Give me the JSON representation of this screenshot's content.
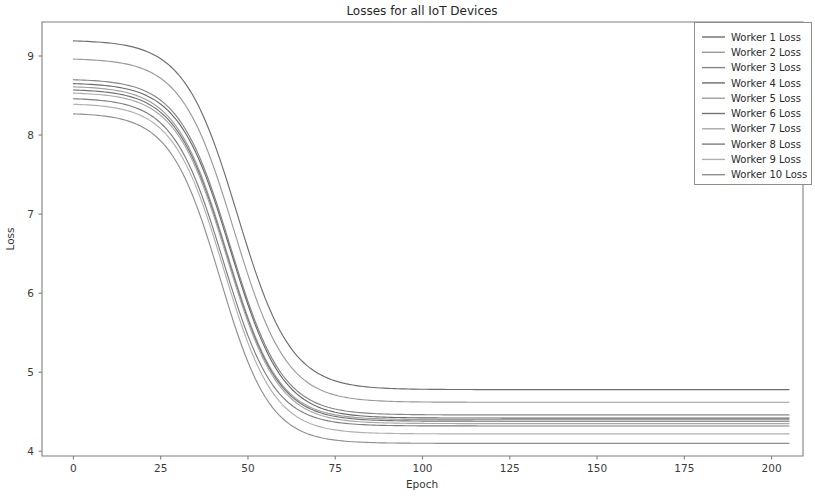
{
  "chart_data": {
    "type": "line",
    "title": "Losses for all  IoT Devices",
    "xlabel": "Epoch",
    "ylabel": "Loss",
    "xlim": [
      -9,
      209
    ],
    "ylim": [
      3.94,
      9.43
    ],
    "xticks": [
      0,
      25,
      50,
      75,
      100,
      125,
      150,
      175,
      200
    ],
    "xtick_labels": [
      "0",
      "25",
      "50",
      "75",
      "100",
      "125",
      "150",
      "175",
      "200"
    ],
    "yticks": [
      4,
      5,
      6,
      7,
      8,
      9
    ],
    "ytick_labels": [
      "4",
      "5",
      "6",
      "7",
      "8",
      "9"
    ],
    "grid": false,
    "legend_position": "upper right",
    "x": [
      0,
      10,
      20,
      30,
      40,
      50,
      60,
      70,
      80,
      90,
      100,
      120,
      140,
      160,
      180,
      200
    ],
    "series": [
      {
        "name": "Worker 1 Loss",
        "color": "#6e6e6e",
        "start": 9.2,
        "end": 4.78,
        "midpoint": 47,
        "rate": 0.072,
        "values": [
          9.2,
          9.02,
          8.65,
          8.1,
          7.4,
          6.66,
          5.98,
          5.45,
          5.12,
          4.94,
          4.86,
          4.8,
          4.78,
          4.78,
          4.78,
          4.78
        ]
      },
      {
        "name": "Worker 2 Loss",
        "color": "#9a9a9a",
        "start": 8.97,
        "end": 4.62,
        "midpoint": 46,
        "rate": 0.073,
        "values": [
          8.97,
          8.79,
          8.42,
          7.87,
          7.17,
          6.45,
          5.78,
          5.26,
          4.94,
          4.77,
          4.69,
          4.64,
          4.62,
          4.62,
          4.62,
          4.62
        ]
      },
      {
        "name": "Worker 3 Loss",
        "color": "#858585",
        "start": 8.71,
        "end": 4.46,
        "midpoint": 45,
        "rate": 0.074,
        "values": [
          8.71,
          8.53,
          8.17,
          7.63,
          6.95,
          6.25,
          5.6,
          5.1,
          4.79,
          4.62,
          4.53,
          4.48,
          4.46,
          4.46,
          4.46,
          4.46
        ]
      },
      {
        "name": "Worker 4 Loss",
        "color": "#6a6a6a",
        "start": 8.66,
        "end": 4.42,
        "midpoint": 45,
        "rate": 0.074,
        "values": [
          8.66,
          8.48,
          8.12,
          7.58,
          6.9,
          6.21,
          5.56,
          5.07,
          4.76,
          4.58,
          4.49,
          4.44,
          4.42,
          4.42,
          4.42,
          4.42
        ]
      },
      {
        "name": "Worker 5 Loss",
        "color": "#9e9e9e",
        "start": 8.62,
        "end": 4.4,
        "midpoint": 44,
        "rate": 0.075,
        "values": [
          8.62,
          8.43,
          8.06,
          7.51,
          6.82,
          6.13,
          5.5,
          5.02,
          4.72,
          4.55,
          4.46,
          4.42,
          4.4,
          4.4,
          4.4,
          4.4
        ]
      },
      {
        "name": "Worker 6 Loss",
        "color": "#737373",
        "start": 8.58,
        "end": 4.38,
        "midpoint": 44,
        "rate": 0.075,
        "values": [
          8.58,
          8.39,
          8.02,
          7.47,
          6.79,
          6.1,
          5.47,
          4.99,
          4.7,
          4.53,
          4.44,
          4.4,
          4.38,
          4.38,
          4.38,
          4.38
        ]
      },
      {
        "name": "Worker 7 Loss",
        "color": "#a8a8a8",
        "start": 8.54,
        "end": 4.35,
        "midpoint": 44,
        "rate": 0.075,
        "values": [
          8.54,
          8.35,
          7.98,
          7.43,
          6.75,
          6.06,
          5.44,
          4.96,
          4.67,
          4.5,
          4.41,
          4.37,
          4.35,
          4.35,
          4.35,
          4.35
        ]
      },
      {
        "name": "Worker 8 Loss",
        "color": "#7d7d7d",
        "start": 8.47,
        "end": 4.32,
        "midpoint": 43,
        "rate": 0.076,
        "values": [
          8.47,
          8.27,
          7.9,
          7.34,
          6.66,
          5.98,
          5.37,
          4.91,
          4.63,
          4.46,
          4.38,
          4.34,
          4.32,
          4.32,
          4.32,
          4.32
        ]
      },
      {
        "name": "Worker 9 Loss",
        "color": "#b0b0b0",
        "start": 8.4,
        "end": 4.22,
        "midpoint": 43,
        "rate": 0.076,
        "values": [
          8.4,
          8.2,
          7.83,
          7.27,
          6.58,
          5.9,
          5.29,
          4.83,
          4.54,
          4.37,
          4.29,
          4.24,
          4.22,
          4.22,
          4.22,
          4.22
        ]
      },
      {
        "name": "Worker 10 Loss",
        "color": "#8f8f8f",
        "start": 8.28,
        "end": 4.1,
        "midpoint": 42,
        "rate": 0.077,
        "values": [
          8.28,
          8.07,
          7.69,
          7.13,
          6.44,
          5.76,
          5.17,
          4.72,
          4.44,
          4.27,
          4.18,
          4.13,
          4.11,
          4.1,
          4.1,
          4.1
        ]
      }
    ]
  }
}
